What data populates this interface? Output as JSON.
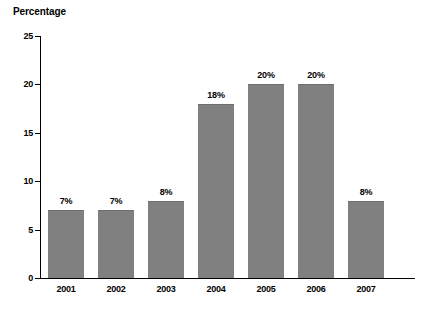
{
  "chart_data": {
    "type": "bar",
    "title": "Percentage",
    "xlabel": "",
    "ylabel": "",
    "categories": [
      "2001",
      "2002",
      "2003",
      "2004",
      "2005",
      "2006",
      "2007"
    ],
    "values": [
      7,
      7,
      8,
      18,
      20,
      20,
      8
    ],
    "value_labels": [
      "7%",
      "7%",
      "8%",
      "18%",
      "20%",
      "20%",
      "8%"
    ],
    "ylim": [
      0,
      25
    ],
    "ytick_labels": [
      "25",
      "20",
      "15",
      "10",
      "5",
      "0"
    ],
    "ytick_values": [
      25,
      20,
      15,
      10,
      5,
      0
    ],
    "grid": false,
    "legend": false,
    "series_color": "#808080",
    "axis_color": "#000000"
  }
}
